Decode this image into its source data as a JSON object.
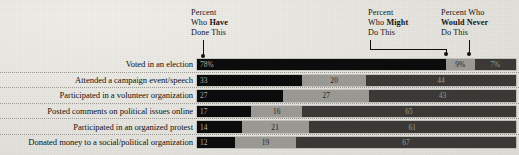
{
  "chart_data": {
    "type": "bar",
    "title": "",
    "subtitle": "",
    "xlabel": "",
    "ylabel": "",
    "stacked": true,
    "orientation": "horizontal",
    "xlim": [
      0,
      100
    ],
    "grid": false,
    "legend_position": "annotations-above-plot",
    "categories": [
      "Voted in an election",
      "Attended a campaign event/speech",
      "Participated in a volunteer organization",
      "Posted comments on political issues online",
      "Participated in an organized protest",
      "Donated money to a social/political organization"
    ],
    "series": [
      {
        "name": "Percent Who Have Done This",
        "values": [
          78,
          33,
          27,
          17,
          14,
          12
        ]
      },
      {
        "name": "Percent Who Might Do This",
        "values": [
          9,
          20,
          27,
          16,
          21,
          19
        ]
      },
      {
        "name": "Percent Who Would Never Do This",
        "values": [
          13,
          47,
          46,
          67,
          65,
          69
        ]
      }
    ],
    "value_labels": [
      {
        "have": "78%",
        "might": "9%",
        "never": "7%"
      },
      {
        "have": "33",
        "might": "20",
        "never": "44"
      },
      {
        "have": "27",
        "might": "27",
        "never": "43"
      },
      {
        "have": "17",
        "might": "16",
        "never": "65"
      },
      {
        "have": "14",
        "might": "21",
        "never": "61"
      },
      {
        "have": "12",
        "might": "19",
        "never": "67"
      }
    ],
    "colors": {
      "have": "#0c0c0c",
      "might": "#9a9893",
      "never": "#3a3935",
      "background": "#e8e6e1"
    }
  },
  "annotations": {
    "have": {
      "line1": "Percent",
      "line2_plain": "Who ",
      "line2_bold": "Have",
      "line3": "Done This"
    },
    "might": {
      "line1": "Percent",
      "line2_plain": "Who ",
      "line2_bold": "Might",
      "line3": "Do This"
    },
    "never": {
      "line1": "Percent Who",
      "line2_plain": "",
      "line2_bold": "Would Never",
      "line3": "Do This"
    }
  }
}
